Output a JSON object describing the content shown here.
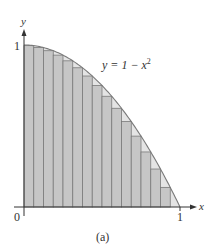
{
  "figure": {
    "caption": "(a)",
    "equation": {
      "lhs": "y = 1 − x",
      "exp": "2"
    },
    "axes": {
      "x_label": "x",
      "y_label": "y",
      "origin_label": "0",
      "x_tick_label": "1",
      "y_tick_label": "1"
    },
    "colors": {
      "rect_fill": "#c6c6c6",
      "gap_fill": "#e4e4e4",
      "line": "#7a7a7a",
      "axis": "#333333"
    }
  },
  "chart_data": {
    "type": "area",
    "title": "",
    "function": "y = 1 - x^2",
    "domain": [
      0,
      1
    ],
    "xlabel": "x",
    "ylabel": "y",
    "xlim": [
      0,
      1
    ],
    "ylim": [
      0,
      1
    ],
    "riemann_sum": {
      "n": 16,
      "endpoint": "right",
      "kind": "lower (inscribed)",
      "x_left_edges": [
        0,
        0.0625,
        0.125,
        0.1875,
        0.25,
        0.3125,
        0.375,
        0.4375,
        0.5,
        0.5625,
        0.625,
        0.6875,
        0.75,
        0.8125,
        0.875,
        0.9375
      ],
      "heights": [
        0.9961,
        0.9844,
        0.9648,
        0.9375,
        0.9023,
        0.8594,
        0.8086,
        0.75,
        0.6836,
        0.6094,
        0.5273,
        0.4375,
        0.3398,
        0.2344,
        0.1211,
        0
      ]
    },
    "grid": false,
    "legend": null
  }
}
